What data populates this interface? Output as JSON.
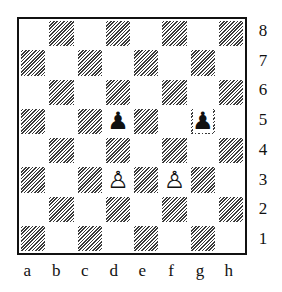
{
  "diagram": {
    "type": "chess-board",
    "orientation": "white-bottom",
    "files": [
      "a",
      "b",
      "c",
      "d",
      "e",
      "f",
      "g",
      "h"
    ],
    "ranks": [
      "8",
      "7",
      "6",
      "5",
      "4",
      "3",
      "2",
      "1"
    ],
    "pieces": [
      {
        "square": "d5",
        "color": "black",
        "type": "pawn",
        "glyph": "♟"
      },
      {
        "square": "g5",
        "color": "black",
        "type": "pawn",
        "glyph": "♟"
      },
      {
        "square": "d3",
        "color": "white",
        "type": "pawn",
        "glyph": "♙"
      },
      {
        "square": "f3",
        "color": "white",
        "type": "pawn",
        "glyph": "♙"
      }
    ],
    "dark_square_style": "diagonal-hatch",
    "colors": {
      "border": "#111111",
      "hatch": "#3a3a3a",
      "light": "#ffffff"
    }
  }
}
